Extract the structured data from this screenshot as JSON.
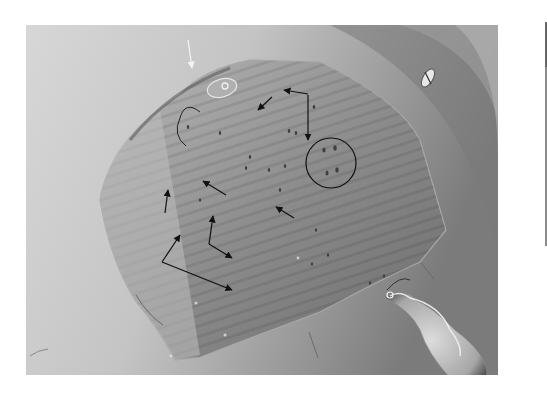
{
  "figure": {
    "type": "grayscale micrograph",
    "annotations": {
      "black_arrows": 9,
      "white_arrows": 1,
      "thin_pointer_lines": 2,
      "circles": 1,
      "circle_note": "cluster of four dark spots encircled"
    }
  },
  "colors": {
    "background": "#ffffff",
    "photo_light": "#dcdcdc",
    "photo_mid": "#a8a8a8",
    "photo_dark": "#6e6e6e",
    "annotation": "#111111"
  }
}
